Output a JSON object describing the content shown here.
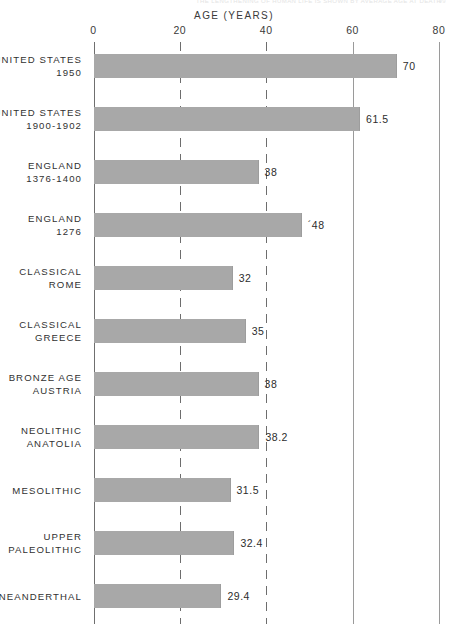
{
  "top_caption": {
    "text": "THE LENGTHENING OF HUMAN LIFE IS SHOWN BY AVERAGE AGE AT DEATH",
    "page": "99"
  },
  "chart_data": {
    "type": "bar",
    "orientation": "horizontal",
    "title": "AGE (YEARS)",
    "xlabel": "AGE (YEARS)",
    "ylabel": "",
    "xlim": [
      0,
      80
    ],
    "xticks": [
      0,
      20,
      40,
      60,
      80
    ],
    "xtick_labels": [
      "0",
      "20",
      "40",
      "60",
      "80"
    ],
    "grid": true,
    "grid_axis": "x",
    "legend": "none",
    "bar_color": "#a8a8a8",
    "categories": [
      "UNITED STATES\n1950",
      "UNITED STATES\n1900-1902",
      "ENGLAND\n1376-1400",
      "ENGLAND\n1276",
      "CLASSICAL\nROME",
      "CLASSICAL\nGREECE",
      "BRONZE AGE\nAUSTRIA",
      "NEOLITHIC\nANATOLIA",
      "MESOLITHIC",
      "UPPER\nPALEOLITHIC",
      "NEANDERTHAL"
    ],
    "values": [
      70,
      61.5,
      38,
      48,
      32,
      35,
      38,
      38.2,
      31.5,
      32.4,
      29.4
    ],
    "value_labels": [
      "70",
      "61.5",
      "38",
      "´48",
      "32",
      "35",
      "38",
      "38.2",
      "31.5",
      "32.4",
      "29.4"
    ]
  }
}
